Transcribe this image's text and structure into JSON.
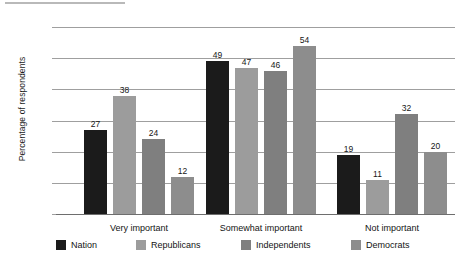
{
  "chart_data": {
    "type": "bar",
    "title": "",
    "subtitle": "",
    "xlabel": "",
    "ylabel": "Percentage of respondents",
    "categories": [
      "Very important",
      "Somewhat important",
      "Not important"
    ],
    "series": [
      {
        "name": "Nation",
        "color": "#1b1b1b",
        "values": [
          27,
          49,
          19
        ]
      },
      {
        "name": "Republicans",
        "color": "#9c9c9c",
        "values": [
          38,
          47,
          11
        ]
      },
      {
        "name": "Independents",
        "color": "#7f7f7f",
        "values": [
          24,
          46,
          32
        ]
      },
      {
        "name": "Democrats",
        "color": "#8d8d8d",
        "values": [
          12,
          54,
          20
        ]
      }
    ],
    "ylim": [
      0,
      60
    ],
    "ytick_step": 10,
    "yticks": [
      "0",
      "10",
      "20",
      "30",
      "40",
      "50",
      "60"
    ],
    "grid": "horizontal",
    "legend_position": "bottom",
    "data_labels": true,
    "orientation": "vertical",
    "grouping": "grouped"
  },
  "axes": {
    "y_title": "Percentage of respondents",
    "y_ticks": [
      "0",
      "10",
      "20",
      "30",
      "40",
      "50",
      "60"
    ],
    "x_categories": [
      "Very important",
      "Somewhat important",
      "Not important"
    ]
  },
  "legend": {
    "items": [
      {
        "label": "Nation",
        "color": "#1b1b1b"
      },
      {
        "label": "Republicans",
        "color": "#9c9c9c"
      },
      {
        "label": "Independents",
        "color": "#7f7f7f"
      },
      {
        "label": "Democrats",
        "color": "#8d8d8d"
      }
    ]
  },
  "values": {
    "very_important": {
      "nation": "27",
      "republicans": "38",
      "independents": "24",
      "democrats": "12"
    },
    "somewhat_important": {
      "nation": "49",
      "republicans": "47",
      "independents": "46",
      "democrats": "54"
    },
    "not_important": {
      "nation": "19",
      "republicans": "11",
      "independents": "32",
      "democrats": "20"
    }
  }
}
